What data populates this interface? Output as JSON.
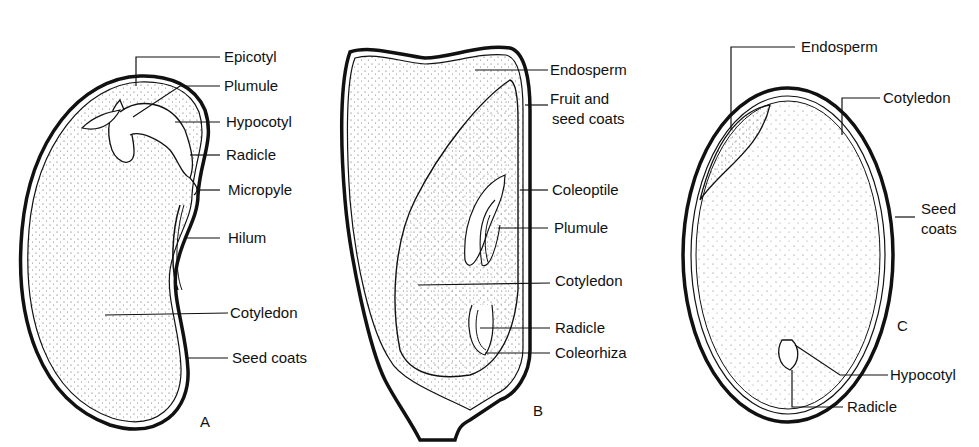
{
  "panels": {
    "A": {
      "letter": "A",
      "labels": [
        "Epicotyl",
        "Plumule",
        "Hypocotyl",
        "Radicle",
        "Micropyle",
        "Hilum",
        "Cotyledon",
        "Seed coats"
      ]
    },
    "B": {
      "letter": "B",
      "labels": [
        "Endosperm",
        "Fruit and",
        "seed coats",
        "Coleoptile",
        "Plumule",
        "Cotyledon",
        "Radicle",
        "Coleorhiza"
      ]
    },
    "C": {
      "letter": "C",
      "labels": [
        "Endosperm",
        "Cotyledon",
        "Seed",
        "coats",
        "Hypocotyl",
        "Radicle"
      ]
    }
  },
  "colors": {
    "ink": "#111111",
    "stipple": "#555555",
    "background": "#ffffff"
  }
}
